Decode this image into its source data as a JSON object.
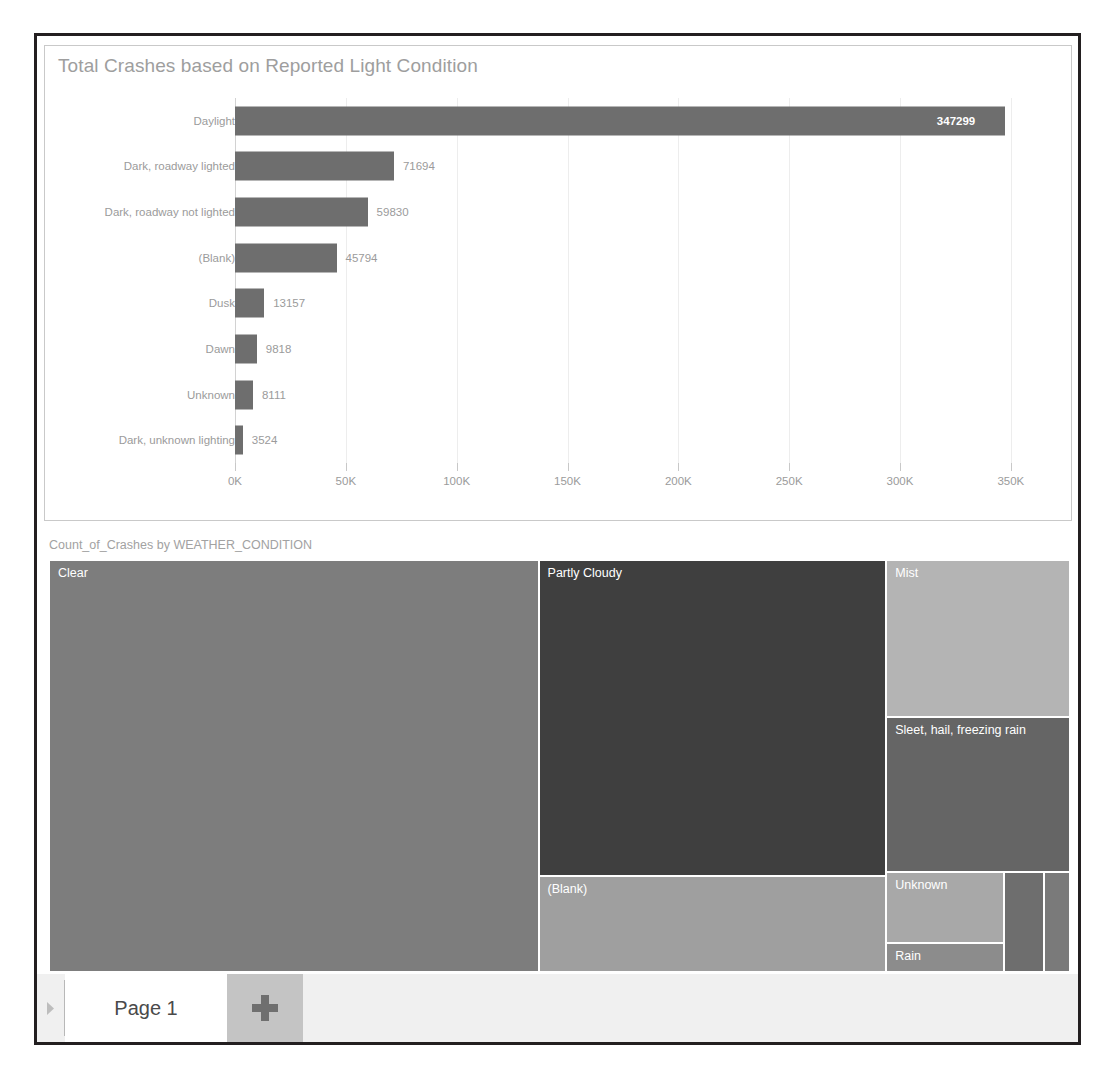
{
  "report": {
    "frame_border_color": "#231f20",
    "background": "#ffffff"
  },
  "bar_visual": {
    "title": "Total Crashes based on Reported Light Condition"
  },
  "treemap_visual": {
    "title": "Count_of_Crashes by WEATHER_CONDITION"
  },
  "page_tabbar": {
    "scroll_left_icon": "chevron-left-icon",
    "tabs": [
      {
        "label": "Page 1",
        "active": true
      }
    ],
    "add_page_icon": "plus-icon",
    "add_page_label": "+"
  },
  "chart_data": [
    {
      "type": "bar",
      "orientation": "horizontal",
      "title": "Total Crashes based on Reported Light Condition",
      "xlabel": "",
      "ylabel": "",
      "categories": [
        "Daylight",
        "Dark, roadway lighted",
        "Dark, roadway not lighted",
        "(Blank)",
        "Dusk",
        "Dawn",
        "Unknown",
        "Dark, unknown lighting"
      ],
      "values": [
        347299,
        71694,
        59830,
        45794,
        13157,
        9818,
        8111,
        3524
      ],
      "value_labels": [
        "347299",
        "71694",
        "59830",
        "45794",
        "13157",
        "9818",
        "8111",
        "3524"
      ],
      "xlim": [
        0,
        360000
      ],
      "xticks": [
        0,
        50000,
        100000,
        150000,
        200000,
        250000,
        300000,
        350000
      ],
      "xticklabels": [
        "0K",
        "50K",
        "100K",
        "150K",
        "200K",
        "250K",
        "300K",
        "350K"
      ],
      "grid": true,
      "legend": false,
      "bar_color": "#6e6e6e",
      "label_color": "#9b9b9b"
    },
    {
      "type": "treemap",
      "title": "Count_of_Crashes by WEATHER_CONDITION",
      "legend": false,
      "tiles": [
        {
          "label": "Clear",
          "color": "#7d7d7d",
          "x": 0.0,
          "y": 0.0,
          "w": 0.4795,
          "h": 1.0
        },
        {
          "label": "Partly Cloudy",
          "color": "#3f3f3f",
          "x": 0.4795,
          "y": 0.0,
          "w": 0.3405,
          "h": 0.768
        },
        {
          "label": "(Blank)",
          "color": "#9f9f9f",
          "x": 0.4795,
          "y": 0.768,
          "w": 0.3405,
          "h": 0.232
        },
        {
          "label": "Mist",
          "color": "#b4b4b4",
          "x": 0.82,
          "y": 0.0,
          "w": 0.18,
          "h": 0.382
        },
        {
          "label": "Sleet, hail, freezing rain",
          "color": "#656565",
          "x": 0.82,
          "y": 0.382,
          "w": 0.18,
          "h": 0.376
        },
        {
          "label": "Unknown",
          "color": "#a8a8a8",
          "x": 0.82,
          "y": 0.758,
          "w": 0.115,
          "h": 0.172
        },
        {
          "label": "Rain",
          "color": "#8c8c8c",
          "x": 0.82,
          "y": 0.93,
          "w": 0.115,
          "h": 0.07
        },
        {
          "label": "",
          "color": "#6e6e6e",
          "x": 0.935,
          "y": 0.758,
          "w": 0.04,
          "h": 0.242
        },
        {
          "label": "",
          "color": "#7a7a7a",
          "x": 0.975,
          "y": 0.758,
          "w": 0.025,
          "h": 0.242
        }
      ]
    }
  ]
}
